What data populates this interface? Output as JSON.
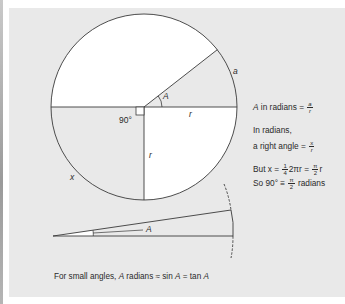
{
  "figure": {
    "type": "radian-definition-diagram",
    "colors": {
      "panel_bg": "#e9e9e9",
      "page_bg": "#ffffff",
      "white_region": "#ffffff",
      "shaded_region": "#e9e9e9",
      "stroke": "#3a3a3a",
      "text": "#2a2a2a"
    },
    "circle": {
      "center": [
        144,
        107
      ],
      "radius": 93,
      "angle_A_degrees": 38,
      "labels": {
        "angle": "A",
        "arc": "a",
        "radius_horizontal": "r",
        "radius_vertical": "r",
        "right_angle": "90°",
        "quarter_arc": "x"
      }
    },
    "small_angle_triangle": {
      "apex": [
        53,
        236
      ],
      "upper_corner": [
        231,
        210
      ],
      "lower_corner": [
        233,
        235
      ],
      "label": "A"
    }
  },
  "notes": {
    "line1": {
      "prefix_italic": "A",
      "text": " in radians = ",
      "frac_num": "a",
      "frac_den": "r"
    },
    "line2": {
      "text": "In radians,"
    },
    "line3": {
      "text": "a right angle = ",
      "frac_num": "x",
      "frac_den": "r"
    },
    "line4": {
      "text_a": "But x = ",
      "frac1_num": "1",
      "frac1_den": "4",
      "text_b": "2πr = ",
      "frac2_num": "π",
      "frac2_den": "2",
      "text_c": "r"
    },
    "line5": {
      "text_a": "So 90° ≡ ",
      "frac_num": "π",
      "frac_den": "2",
      "text_b": " radians"
    }
  },
  "caption": {
    "text_a": "For small angles, ",
    "italic_a1": "A",
    "text_b": " radians ≈ sin ",
    "italic_a2": "A",
    "text_c": " = tan ",
    "italic_a3": "A"
  }
}
